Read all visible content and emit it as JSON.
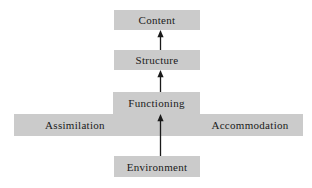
{
  "diagram": {
    "palette": {
      "box_fill": "#cbcbcb",
      "background": "#ffffff",
      "arrow": "#1a1a1a",
      "text": "#1a1a1a"
    },
    "nodes": [
      {
        "id": "content",
        "label": "Content"
      },
      {
        "id": "structure",
        "label": "Structure"
      },
      {
        "id": "functioning",
        "label": "Functioning"
      },
      {
        "id": "environment",
        "label": "Environment"
      }
    ],
    "bar_labels": [
      {
        "id": "assimilation",
        "label": "Assimilation"
      },
      {
        "id": "accommodation",
        "label": "Accommodation"
      }
    ],
    "arrows": [
      {
        "id": "structure-to-content",
        "from": "Structure",
        "to": "Content",
        "direction": "up"
      },
      {
        "id": "functioning-to-structure",
        "from": "Functioning",
        "to": "Structure",
        "direction": "up"
      },
      {
        "id": "environment-to-functioning",
        "from": "Environment",
        "to": "Functioning",
        "direction": "up"
      }
    ]
  }
}
